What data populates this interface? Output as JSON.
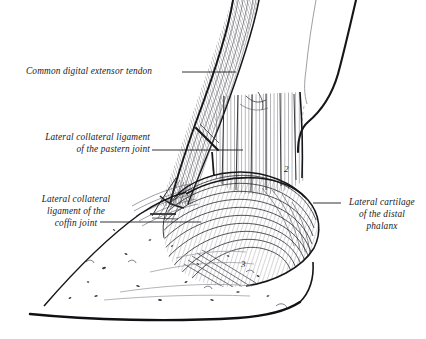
{
  "figure": {
    "kind": "anatomical-line-drawing",
    "background_color": "#ffffff",
    "ink_color": "#16161a",
    "width": 426,
    "height": 339
  },
  "labels": [
    {
      "id": "extensor",
      "name": "common-digital-extensor-tendon",
      "lines": [
        "Common digital extensor tendon"
      ],
      "align": "left",
      "leader": {
        "x1": 182,
        "y1": 72,
        "x2": 236,
        "y2": 72
      }
    },
    {
      "id": "pastern",
      "name": "lateral-collateral-ligament-pastern-joint",
      "lines": [
        "Lateral collateral ligament",
        "of the pastern joint"
      ],
      "align": "right",
      "leader": {
        "x1": 152,
        "y1": 150,
        "x2": 243,
        "y2": 150
      }
    },
    {
      "id": "coffin",
      "name": "lateral-collateral-ligament-coffin-joint",
      "lines": [
        "Lateral collateral",
        "ligament of the",
        "coffin joint"
      ],
      "align": "center",
      "leader": {
        "x1": 100,
        "y1": 222,
        "x2": 201,
        "y2": 222
      }
    },
    {
      "id": "cartilage",
      "name": "lateral-cartilage-distal-phalanx",
      "lines": [
        "Lateral cartilage",
        "of the distal",
        "phalanx"
      ],
      "align": "center",
      "leader": {
        "x1": 313,
        "y1": 203,
        "x2": 341,
        "y2": 203
      }
    }
  ],
  "numerals": [
    {
      "id": "n2",
      "text": "2",
      "x": 284,
      "y": 164
    },
    {
      "id": "n3",
      "text": "3",
      "x": 241,
      "y": 259
    }
  ],
  "structures": [
    {
      "name": "common-digital-extensor-tendon",
      "style": "striated-band"
    },
    {
      "name": "pastern-region",
      "style": "vertical-striations"
    },
    {
      "name": "lateral-cartilage",
      "style": "contour-hatching"
    },
    {
      "name": "hoof-wall",
      "style": "stipple"
    },
    {
      "name": "collateral-ligaments",
      "style": "fine-fiber-lines"
    }
  ]
}
